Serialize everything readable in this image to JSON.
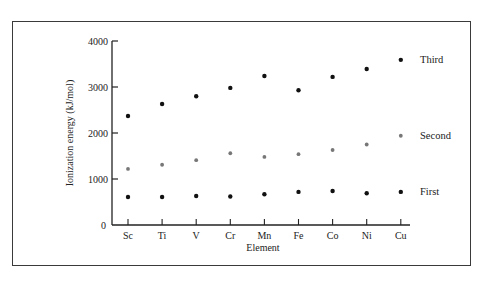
{
  "chart_data": {
    "type": "scatter",
    "title": "",
    "xlabel": "Element",
    "ylabel": "Ionization energy (kJ/mol)",
    "ylim": [
      0,
      4000
    ],
    "yticks": [
      0,
      1000,
      2000,
      3000,
      4000
    ],
    "categories": [
      "Sc",
      "Ti",
      "V",
      "Cr",
      "Mn",
      "Fe",
      "Co",
      "Ni",
      "Cu"
    ],
    "grid": false,
    "legend_position": "inline-right",
    "series": [
      {
        "name": "First",
        "color": "#111111",
        "values": [
          610,
          610,
          630,
          620,
          670,
          720,
          740,
          690,
          720
        ]
      },
      {
        "name": "Second",
        "color": "#777777",
        "values": [
          1220,
          1310,
          1410,
          1560,
          1480,
          1540,
          1630,
          1750,
          1940
        ]
      },
      {
        "name": "Third",
        "color": "#111111",
        "values": [
          2370,
          2630,
          2800,
          2980,
          3240,
          2930,
          3220,
          3390,
          3590
        ]
      }
    ]
  }
}
